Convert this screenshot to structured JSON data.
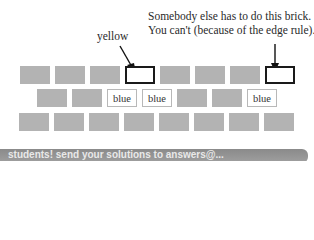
{
  "annotations": {
    "right_line1": "Somebody else has to do this brick.",
    "right_line2": "You can't (because of the edge rule).",
    "left": "yellow"
  },
  "wall": {
    "row1": [
      "",
      "",
      "",
      "outlined",
      "",
      "",
      "",
      "outlined"
    ],
    "row2": [
      "",
      "",
      "blue",
      "blue",
      "",
      "",
      "blue"
    ],
    "row3": [
      "",
      "",
      "",
      "",
      "",
      "",
      "",
      ""
    ],
    "label_text": "blue"
  },
  "banner": {
    "text": "students! send your solutions to answers@..."
  },
  "colors": {
    "brick_grey": "#b3b3b3",
    "outline": "#1a1a1a",
    "banner": "#9a9a9a"
  }
}
